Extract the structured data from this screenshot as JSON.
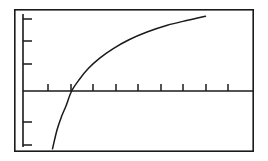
{
  "chart_data": {
    "type": "line",
    "title": "",
    "subtitle": "",
    "xlabel": "",
    "ylabel": "",
    "legend": [],
    "legend_position": "none",
    "grid": false,
    "annotations": [],
    "xlim": [
      0,
      10
    ],
    "ylim": [
      -3,
      3
    ],
    "xticks": [
      1,
      2,
      3,
      4,
      5,
      6,
      7,
      8,
      9
    ],
    "yticks": [
      -3,
      -2,
      1,
      2,
      3
    ],
    "xtick_labels": [
      "",
      "",
      "",
      "",
      "",
      "",
      "",
      "",
      ""
    ],
    "ytick_labels": [
      "",
      "",
      "",
      "",
      ""
    ],
    "axis_origin": [
      0,
      0
    ],
    "x_axis_crossing": 2.05,
    "series": [
      {
        "name": "logarithmic-curve",
        "color": "#1a1a1a",
        "x": [
          1.2,
          1.4,
          1.6,
          1.8,
          2.05,
          2.4,
          2.8,
          3.3,
          3.9,
          4.6,
          5.4,
          6.3,
          7.2,
          8.0
        ],
        "y": [
          -2.55,
          -1.72,
          -1.13,
          -0.66,
          0.0,
          0.52,
          1.0,
          1.45,
          1.87,
          2.26,
          2.6,
          2.9,
          3.12,
          3.3
        ]
      }
    ]
  },
  "figure": {
    "background_color": "#ffffff",
    "stroke_color": "#1a1a1a",
    "frame": {
      "x": 14,
      "y": 9,
      "width": 240,
      "height": 143
    },
    "plot_area": {
      "x_axis_y": 91,
      "y_axis_x": 23,
      "x_axis_end": 254,
      "y_axis_top": 14,
      "y_axis_bottom": 147
    },
    "x_tick_positions": [
      48,
      71,
      93,
      116,
      138,
      161,
      183,
      206,
      228
    ],
    "x_tick_length": 7,
    "y_tick_positions": [
      19,
      41,
      64,
      122,
      145
    ],
    "y_tick_length": 9,
    "curve_path": "M 51.5 150.5 C 55.5 133 61 112 67 100 C 75 85 88 68 104 53 C 122 37 152 22 202 13.5"
  },
  "accessibility": {
    "figure_description": "Graph of a logarithmic curve on a framed coordinate axis system with unlabeled tick marks",
    "curve_description": "Curve rises steeply from below the horizontal axis, crosses it near the second tick, then flattens as it rises to the upper right"
  }
}
